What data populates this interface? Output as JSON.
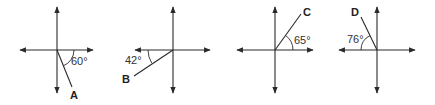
{
  "diagrams": [
    {
      "ray_label": "A",
      "angle_label": "60°"
    },
    {
      "ray_label": "B",
      "angle_label": "42°"
    },
    {
      "ray_label": "C",
      "angle_label": "65°"
    },
    {
      "ray_label": "D",
      "angle_label": "76°"
    }
  ]
}
